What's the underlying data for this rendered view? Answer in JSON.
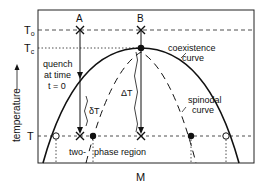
{
  "figure": {
    "axes": {
      "xlabel": "M",
      "ylabel": "temperature",
      "ylabel_arrow": "up-arrow"
    },
    "temperature_levels": {
      "T0": {
        "label_main": "T",
        "label_sub": "o"
      },
      "Tc": {
        "label_main": "T",
        "label_sub": "c"
      },
      "T": {
        "label_main": "T"
      }
    },
    "points": {
      "A": "A",
      "B": "B"
    },
    "annotations": {
      "quench_line1": "quench",
      "quench_line2": "at time",
      "quench_line3": "t = 0",
      "delta_small": "δT",
      "delta_large": "ΔT",
      "coexistence_line1": "coexistence",
      "coexistence_line2": "curve",
      "spinodal_line1": "spinodal",
      "spinodal_line2": "curve",
      "region_part1": "two-",
      "region_part2": "phase region"
    },
    "colors": {
      "ink": "#111111",
      "background": "#ffffff"
    }
  }
}
